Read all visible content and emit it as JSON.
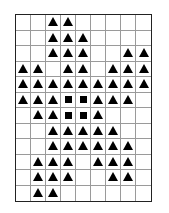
{
  "puzzle": {
    "columns": 9,
    "rows": 12,
    "legend": {
      "T": "triangle",
      "S": "square",
      ".": "empty"
    },
    "colors": {
      "shape": "#000000",
      "grid_line": "#9a9a9a",
      "border": "#222222",
      "background": "#ffffff"
    },
    "grid": [
      [
        ".",
        ".",
        "T",
        "T",
        ".",
        ".",
        ".",
        ".",
        "."
      ],
      [
        ".",
        ".",
        "T",
        "T",
        "T",
        ".",
        ".",
        ".",
        "."
      ],
      [
        ".",
        ".",
        "T",
        "T",
        "T",
        ".",
        ".",
        "T",
        "T"
      ],
      [
        "T",
        "T",
        ".",
        "T",
        "T",
        ".",
        "T",
        "T",
        "T"
      ],
      [
        "T",
        "T",
        "T",
        "T",
        "T",
        "T",
        "T",
        "T",
        "T"
      ],
      [
        "T",
        "T",
        "T",
        "S",
        "S",
        "T",
        "T",
        "T",
        "."
      ],
      [
        ".",
        "T",
        "T",
        "S",
        "S",
        "T",
        ".",
        ".",
        "."
      ],
      [
        ".",
        ".",
        "T",
        "T",
        "T",
        "T",
        "T",
        ".",
        "."
      ],
      [
        ".",
        ".",
        "T",
        "T",
        "T",
        "T",
        "T",
        "T",
        "."
      ],
      [
        ".",
        "T",
        "T",
        "T",
        ".",
        "T",
        "T",
        "T",
        "."
      ],
      [
        ".",
        "T",
        "T",
        "T",
        ".",
        ".",
        "T",
        "T",
        "."
      ],
      [
        ".",
        "T",
        "T",
        ".",
        ".",
        ".",
        ".",
        ".",
        "."
      ]
    ]
  }
}
